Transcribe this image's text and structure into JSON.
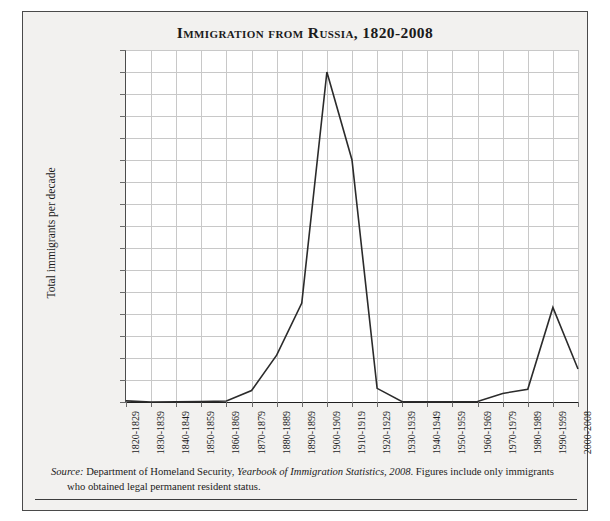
{
  "figure": {
    "title": "Immigration from Russia, 1820-2008",
    "source_prefix": "Source:",
    "source_text_1": " Department of Homeland Security, ",
    "source_italic": "Yearbook of Immigration Statistics, 2008",
    "source_text_2": ". Figures include only immigrants who obtained legal permanent resident status."
  },
  "colors": {
    "page_background": "#f2f1ef",
    "plot_background": "#ffffff",
    "frame_border": "#4a4a4a",
    "gridline": "#c8c8c8",
    "axis": "#1f1f1f",
    "data_line": "#2b2b2b",
    "text": "#1b1b1b"
  },
  "chart_data": {
    "type": "line",
    "title": "Immigration from Russia, 1820-2008",
    "xlabel": "",
    "ylabel": "Total immigrants per decade",
    "ylim": [
      0,
      1600000
    ],
    "ytick_step": 100000,
    "grid": true,
    "legend": false,
    "categories": [
      "1820-1829",
      "1830-1839",
      "1840-1849",
      "1850-1859",
      "1860-1869",
      "1870-1879",
      "1880-1889",
      "1890-1899",
      "1900-1909",
      "1910-1919",
      "1920-1929",
      "1930-1939",
      "1940-1949",
      "1950-1959",
      "1960-1969",
      "1970-1979",
      "1980-1989",
      "1990-1999",
      "2000-2008"
    ],
    "ytick_labels": [
      "1,600,000",
      "1,500,000",
      "1,400,000",
      "1,300,000",
      "1,200,000",
      "1,100,000",
      "1,000,000",
      "900,000",
      "800,000",
      "700,000",
      "600,000",
      "500,000",
      "400,000",
      "300,000",
      "200,000",
      "100,000",
      "0"
    ],
    "ytick_values": [
      1600000,
      1500000,
      1400000,
      1300000,
      1200000,
      1100000,
      1000000,
      900000,
      800000,
      700000,
      600000,
      500000,
      400000,
      300000,
      200000,
      100000,
      0
    ],
    "series": [
      {
        "name": "Total immigrants per decade",
        "values": [
          5000,
          300,
          500,
          1600,
          4500,
          52000,
          213000,
          450000,
          1500000,
          1100000,
          62000,
          1400,
          600,
          1100,
          2500,
          39000,
          58000,
          430000,
          150000
        ]
      }
    ]
  }
}
